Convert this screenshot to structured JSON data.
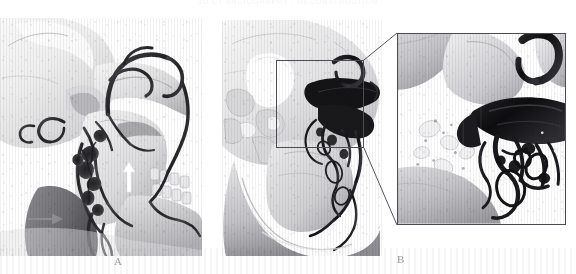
{
  "figure": {
    "header_text": "3D CT ANGIOGRAPHY  ·  RECONSTRUCTION",
    "background_color": "#ffffff",
    "width": 576,
    "height": 274
  },
  "panels": [
    {
      "id": "panel-a",
      "letter": "A",
      "role": "preoperative-3d-ct-angiography-lateral-skull",
      "x": 0,
      "y": 18,
      "width": 202,
      "height": 238
    },
    {
      "id": "panel-b",
      "letter": "B",
      "role": "postoperative-3d-ct-angiography-lateral-skull",
      "x": 222,
      "y": 20,
      "width": 160,
      "height": 236
    },
    {
      "id": "panel-inset",
      "letter": "",
      "role": "magnified-region-of-interest",
      "x": 397,
      "y": 33,
      "width": 169,
      "height": 192
    }
  ],
  "roi": {
    "label": "region-of-interest",
    "x": 276,
    "y": 60,
    "width": 88,
    "height": 88,
    "border_color": "#4b4b52"
  },
  "annotations": [
    {
      "name": "white-arrow-up",
      "description": "white arrow pointing superiorly at maxillary region",
      "color": "#ffffff",
      "direction": "up",
      "x": 128,
      "y": 163
    },
    {
      "name": "gray-arrow-right",
      "description": "gray arrow pointing right at cervical vascular structure",
      "color": "#8b8b92",
      "direction": "right",
      "x": 28,
      "y": 218
    }
  ],
  "colors": {
    "bone_light": "#f2f2f2",
    "bone_mid": "#c9c9cb",
    "bone_shadow": "#8e8e92",
    "vessel_dark": "#2a2a2d",
    "vessel_black": "#121214",
    "frame": "#4b4b52",
    "caption": "#9a9aa0"
  },
  "captions": {
    "a": "A",
    "b": "B"
  }
}
